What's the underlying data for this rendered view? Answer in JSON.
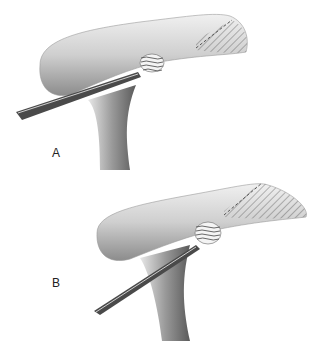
{
  "figure": {
    "panels": [
      {
        "id": "A",
        "label": "A"
      },
      {
        "id": "B",
        "label": "B"
      }
    ],
    "colors": {
      "bone_light": "#e6e6e6",
      "bone_mid": "#b4b4b4",
      "bone_dark": "#6e6e6e",
      "instrument": "#4a4a4a",
      "hatch": "#555555"
    }
  }
}
